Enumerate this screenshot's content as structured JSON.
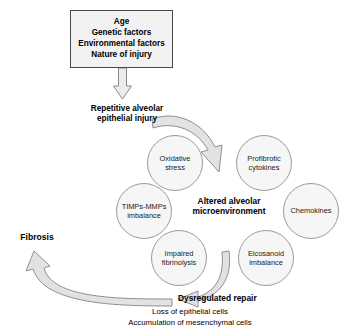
{
  "diagram": {
    "colors": {
      "box_fill": "#f2f2f2",
      "box_border": "#4a4a4a",
      "bubble_fill": "#f6f6f6",
      "bubble_border": "#9a9a9a",
      "arrow_outline": "#808080",
      "arrow_fill": "#e8e8e8",
      "text": "#000000",
      "background": "#ffffff"
    },
    "risk_box": {
      "name": "risk-factors-box",
      "lines": [
        "Age",
        "Genetic factors",
        "Environmental factors",
        "Nature of injury"
      ]
    },
    "nodes": {
      "injury": "Repetitive alveolar\nepithelial injury",
      "center": "Altered alveolar\nmicroenvironment",
      "fibrosis": "Fibrosis",
      "dysregulated_repair": "Dysregulated repair",
      "dysregulated_sub1": "Loss of epithelial cells",
      "dysregulated_sub2": "Accumulation of mesenchymal cells"
    },
    "bubbles": [
      {
        "id": "oxidative-stress",
        "label": "Oxidative\nstress",
        "cx": 175,
        "cy": 163,
        "r": 28
      },
      {
        "id": "profibrotic-cytokines",
        "label": "Profibrotic\ncytokines",
        "cx": 264,
        "cy": 163,
        "r": 28
      },
      {
        "id": "chemokines",
        "label": "Chemokines",
        "cx": 311,
        "cy": 211,
        "r": 28
      },
      {
        "id": "timps-mmps",
        "label": "TIMPs-MMPs\nimbalance",
        "cx": 144,
        "cy": 211,
        "r": 28
      },
      {
        "id": "impaired-fibrinolysis",
        "label": "Impaired\nfibrinolysis",
        "cx": 179,
        "cy": 258,
        "r": 28
      },
      {
        "id": "eicosanoid-imbalance",
        "label": "Eicosanoid\nimbalance",
        "cx": 266,
        "cy": 258,
        "r": 28
      }
    ],
    "arrows": [
      {
        "id": "arrow-box-to-injury",
        "kind": "straight-down"
      },
      {
        "id": "arrow-injury-to-microenvironment",
        "kind": "curved-clockwise"
      },
      {
        "id": "arrow-microenvironment-to-repair",
        "kind": "curved-down-left"
      },
      {
        "id": "arrow-repair-to-fibrosis",
        "kind": "curved-up-left"
      }
    ]
  }
}
